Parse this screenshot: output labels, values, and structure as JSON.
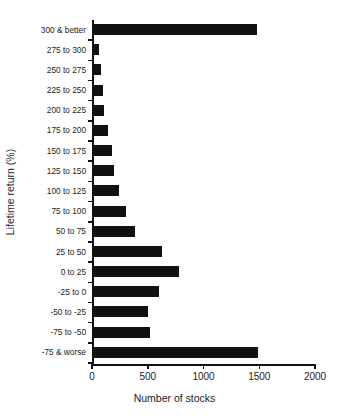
{
  "chart_data": {
    "type": "bar",
    "orientation": "horizontal",
    "title": "",
    "xlabel": "Number of stocks",
    "ylabel": "Lifetime return (%)",
    "xlim": [
      0,
      2000
    ],
    "xticks": [
      0,
      500,
      1000,
      1500,
      2000
    ],
    "xtick_labels": [
      "0",
      "500",
      "1000",
      "1500",
      "2000"
    ],
    "grid": false,
    "legend": null,
    "bar_color": "#111111",
    "categories": [
      "300 & better",
      "275 to 300",
      "250 to 275",
      "225 to 250",
      "200 to 225",
      "175 to 200",
      "150 to 175",
      "125 to 150",
      "100 to 125",
      "75 to 100",
      "50 to 75",
      "25 to 50",
      "0 to 25",
      "-25 to 0",
      "-50 to -25",
      "-75 to -50",
      "-75 & worse"
    ],
    "values": [
      1480,
      65,
      85,
      95,
      110,
      140,
      175,
      195,
      245,
      305,
      390,
      630,
      780,
      600,
      500,
      520,
      1490
    ]
  }
}
